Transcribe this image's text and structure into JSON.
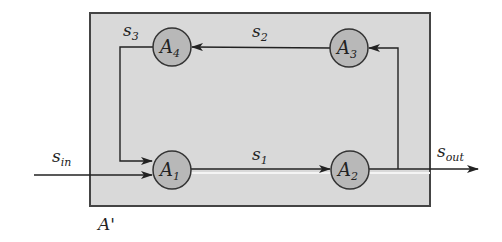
{
  "diagram": {
    "container": {
      "label": "A'",
      "fill": "#d9d9d9",
      "stroke": "#444444"
    },
    "nodes": [
      {
        "id": "A1",
        "base": "A",
        "sub": "1",
        "cx": 172,
        "cy": 170
      },
      {
        "id": "A2",
        "base": "A",
        "sub": "2",
        "cx": 350,
        "cy": 170
      },
      {
        "id": "A3",
        "base": "A",
        "sub": "3",
        "cx": 349,
        "cy": 48
      },
      {
        "id": "A4",
        "base": "A",
        "sub": "4",
        "cx": 172,
        "cy": 47
      }
    ],
    "node_fill": "#b8b8b8",
    "edges": [
      {
        "id": "s1",
        "base": "s",
        "sub": "1",
        "from": "A1",
        "to": "A2"
      },
      {
        "id": "s2",
        "base": "s",
        "sub": "2",
        "from": "A3",
        "to": "A4"
      },
      {
        "id": "s3",
        "base": "s",
        "sub": "3",
        "from": "A4",
        "to": "A1"
      },
      {
        "id": "s_in",
        "base": "s",
        "sub": "in",
        "from": "external",
        "to": "A1"
      },
      {
        "id": "s_out",
        "base": "s",
        "sub": "out",
        "from": "A2",
        "to": "external"
      }
    ],
    "feedback": {
      "from": "A2",
      "to": "A3"
    }
  }
}
